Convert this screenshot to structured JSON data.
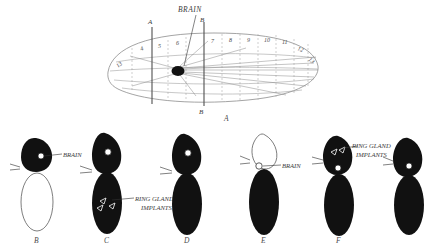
{
  "figure": {
    "caption_labels": [
      "A",
      "B",
      "C",
      "D",
      "E",
      "F"
    ],
    "top_label": "BRAIN",
    "axis_labels": {
      "a": "A",
      "b": "B",
      "a_bottom": "A",
      "b_bottom": "B"
    },
    "fate_map": {
      "panel_label": "A",
      "segment_numbers": [
        "13",
        "4",
        "5",
        "6",
        "7",
        "8",
        "9",
        "10",
        "11",
        "12",
        "13"
      ],
      "brain_label": "BRAIN",
      "axis_a_label": "A",
      "axis_b_label": "B",
      "axis_b_bottom_label": "B"
    },
    "specimens": [
      {
        "label": "B",
        "head_filled": false,
        "body_filled": false,
        "annotations": [
          {
            "text": "BRAIN",
            "kind": "brain-callout"
          }
        ]
      },
      {
        "label": "C",
        "head_filled": true,
        "body_filled": true,
        "annotations": [
          {
            "text": "RING GLAND",
            "text2": "IMPLANTS",
            "kind": "ring-gland-callout"
          }
        ]
      },
      {
        "label": "D",
        "head_filled": true,
        "body_filled": true,
        "annotations": []
      },
      {
        "label": "E",
        "head_filled": false,
        "body_filled": true,
        "annotations": [
          {
            "text": "BRAIN",
            "kind": "brain-callout"
          }
        ]
      },
      {
        "label": "F",
        "head_filled": true,
        "body_filled": true,
        "annotations": [
          {
            "text": "RING GLAND",
            "text2": "IMPLANTS",
            "kind": "ring-gland-callout"
          }
        ]
      },
      {
        "label": "",
        "head_filled": true,
        "body_filled": true,
        "annotations": []
      }
    ],
    "colors": {
      "ink": "#111111",
      "line": "#8d8d8d",
      "text": "#4a4a4a",
      "background": "#ffffff"
    }
  }
}
